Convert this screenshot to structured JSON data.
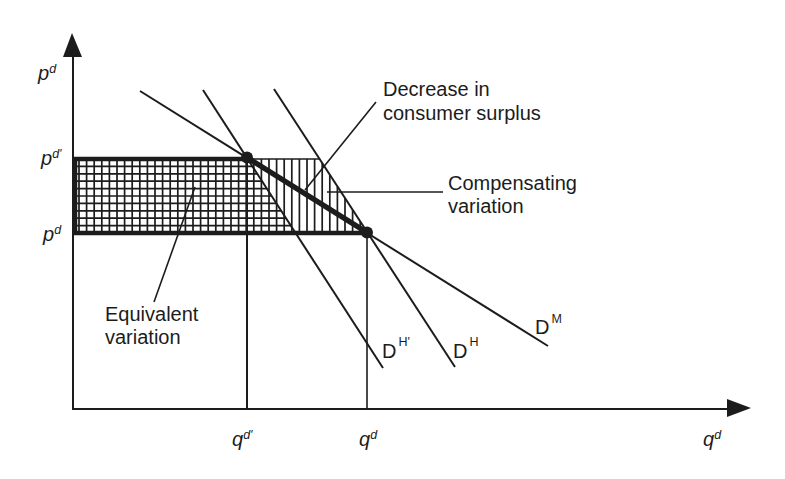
{
  "diagram": {
    "title": "",
    "axes": {
      "y": {
        "base": "p",
        "sup": "d"
      },
      "x": {
        "base": "q",
        "sup": "d"
      }
    },
    "y_ticks": [
      {
        "base": "p",
        "sup": "d'"
      },
      {
        "base": "p",
        "sup": "d"
      }
    ],
    "x_ticks": [
      {
        "base": "q",
        "sup": "d'"
      },
      {
        "base": "q",
        "sup": "d"
      }
    ],
    "curves": [
      {
        "id": "hicksian-prime",
        "base": "D",
        "sup": "H'"
      },
      {
        "id": "hicksian",
        "base": "D",
        "sup": "H"
      },
      {
        "id": "marshallian",
        "base": "D",
        "sup": "M"
      }
    ],
    "annotations": {
      "decrease_cs": {
        "line1": "Decrease in",
        "line2": "consumer surplus"
      },
      "compensating": {
        "line1": "Compensating",
        "line2": "variation"
      },
      "equivalent": {
        "line1": "Equivalent",
        "line2": "variation"
      }
    },
    "points": [
      {
        "name": "old-equilibrium",
        "at": "(q^d', p^d')"
      },
      {
        "name": "new-equilibrium",
        "at": "(q^d, p^d)"
      }
    ],
    "colors": {
      "ink": "#1c1c1c",
      "background": "#ffffff"
    }
  }
}
